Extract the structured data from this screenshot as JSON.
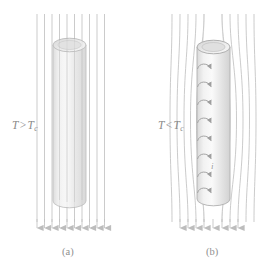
{
  "figure": {
    "kind": "physics-diagram",
    "topic": "Meissner effect of a superconducting cylinder in an axial magnetic field",
    "background_color": "#ffffff",
    "line_color": "#b9b9b9",
    "text_color": "#8a8a8a",
    "cylinder_fill": "#e3e3e3",
    "cylinder_edge": "#b0b0b0"
  },
  "panels": [
    {
      "id": "panel-a",
      "caption": "(a)",
      "temperature": {
        "symbol": "T",
        "operator": ">",
        "critical_symbol": "T",
        "critical_subscript": "c",
        "full_text": "T > Tc"
      },
      "state": "normal",
      "field_lines": {
        "count": 10,
        "shape": "straight-vertical",
        "penetrates_cylinder": true,
        "arrow_direction": "down",
        "arrow_count": 10
      },
      "cylinder": {
        "has_top_ellipse": true,
        "has_surface_currents": false,
        "current_arrow_count": 0
      }
    },
    {
      "id": "panel-b",
      "caption": "(b)",
      "temperature": {
        "symbol": "T",
        "operator": "<",
        "critical_symbol": "T",
        "critical_subscript": "c",
        "full_text": "T < Tc"
      },
      "state": "superconducting",
      "field_lines": {
        "count": 10,
        "shape": "curved-expelled-around-cylinder",
        "penetrates_cylinder": false,
        "arrow_direction": "down",
        "arrow_count": 8
      },
      "cylinder": {
        "has_top_ellipse": true,
        "has_surface_currents": true,
        "current_arrow_count": 8,
        "current_label": "i"
      }
    }
  ],
  "labels": {
    "panel_a_temp_prefix": "T",
    "panel_a_operator": ">",
    "panel_a_temp_crit": "T",
    "panel_a_subscript": "c",
    "panel_b_temp_prefix": "T",
    "panel_b_operator": "<",
    "panel_b_temp_crit": "T",
    "panel_b_subscript": "c",
    "caption_a": "(a)",
    "caption_b": "(b)",
    "current_symbol": "i"
  }
}
